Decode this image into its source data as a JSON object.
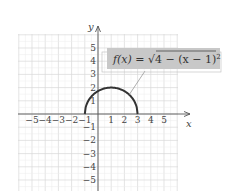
{
  "chart_data": {
    "type": "line",
    "title": "",
    "function_label": "f(x) = √(4 − (x − 1)²)",
    "label_parts": {
      "lhs": "f(x) = ",
      "radical": "√",
      "radicand": "4 − (x − 1)",
      "exp": "2"
    },
    "xlabel": "x",
    "ylabel": "y",
    "xlim": [
      -6,
      6
    ],
    "ylim": [
      -6,
      6
    ],
    "grid": true,
    "x_ticks": [
      "−5",
      "−4",
      "−3",
      "−2",
      "−1",
      "1",
      "2",
      "3",
      "4",
      "5"
    ],
    "y_ticks": [
      "5",
      "4",
      "3",
      "2",
      "1",
      "−1",
      "−2",
      "−3",
      "−4",
      "−5"
    ],
    "series": [
      {
        "name": "f(x) = sqrt(4 - (x-1)^2)",
        "description": "upper semicircle, center (1,0), radius 2",
        "x": [
          -1,
          -0.5,
          0,
          0.5,
          1,
          1.5,
          2,
          2.5,
          3
        ],
        "y": [
          0,
          1.32,
          1.73,
          1.94,
          2,
          1.94,
          1.73,
          1.32,
          0
        ]
      }
    ],
    "colors": {
      "curve": "#333333",
      "grid": "#d8d8d8",
      "label_box": "#c8c8c8",
      "axis": "#555555"
    }
  }
}
